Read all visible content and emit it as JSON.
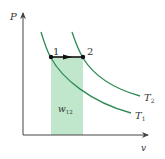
{
  "diagram": {
    "type": "P-v diagram, isobaric expansion between isotherms",
    "axes": {
      "y_label": "P",
      "x_label": "v"
    },
    "points": [
      {
        "label": "1",
        "x": 51,
        "y": 57
      },
      {
        "label": "2",
        "x": 83,
        "y": 57
      }
    ],
    "curves": [
      {
        "label": "T",
        "subscript": "1",
        "name": "isotherm-T1"
      },
      {
        "label": "T",
        "subscript": "2",
        "name": "isotherm-T2"
      }
    ],
    "work_area": {
      "label": "w",
      "subscript": "12"
    },
    "colors": {
      "curve": "#2e8b57",
      "area_fill": "#b9e3c6",
      "axis": "#444444",
      "process_line": "#111111"
    }
  }
}
